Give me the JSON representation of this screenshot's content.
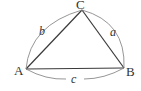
{
  "diagram": {
    "type": "triangle",
    "vertices": [
      {
        "id": "A",
        "label": "A"
      },
      {
        "id": "B",
        "label": "B"
      },
      {
        "id": "C",
        "label": "C"
      }
    ],
    "sides": [
      {
        "id": "a",
        "label": "a",
        "between": [
          "B",
          "C"
        ]
      },
      {
        "id": "b",
        "label": "b",
        "between": [
          "A",
          "C"
        ]
      },
      {
        "id": "c",
        "label": "c",
        "between": [
          "A",
          "B"
        ]
      }
    ],
    "colors": {
      "line": "#3a3a3a",
      "arc": "#8a8a8a",
      "text": "#333333"
    }
  }
}
